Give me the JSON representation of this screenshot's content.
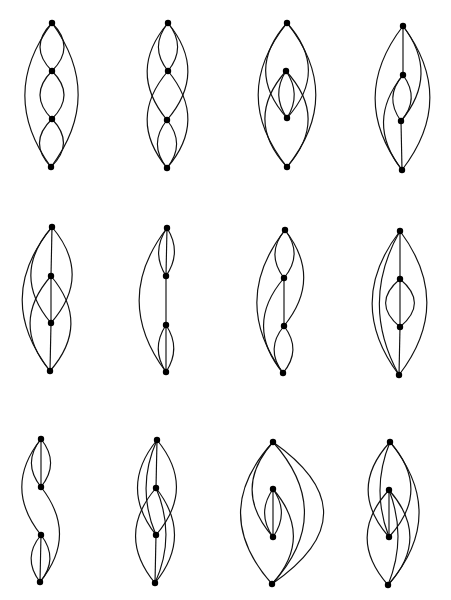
{
  "colors": {
    "edge": "#111111",
    "node": "#000000",
    "background": "#ffffff"
  },
  "graphs": [
    {
      "id": "g1",
      "edges": [
        {
          "a": 0,
          "b": 1,
          "bend": 0.5
        },
        {
          "a": 0,
          "b": 1,
          "bend": -0.5
        },
        {
          "a": 1,
          "b": 2,
          "bend": 0.5
        },
        {
          "a": 1,
          "b": 2,
          "bend": -0.5
        },
        {
          "a": 2,
          "b": 3,
          "bend": 0.5
        },
        {
          "a": 2,
          "b": 3,
          "bend": -0.5
        },
        {
          "a": 0,
          "b": 3,
          "bend": 0.37
        },
        {
          "a": 0,
          "b": 3,
          "bend": -0.37
        }
      ]
    },
    {
      "id": "g2",
      "edges": [
        {
          "a": 0,
          "b": 1,
          "bend": 0.4
        },
        {
          "a": 0,
          "b": 1,
          "bend": -0.4
        },
        {
          "a": 2,
          "b": 3,
          "bend": 0.4
        },
        {
          "a": 2,
          "b": 3,
          "bend": -0.4
        },
        {
          "a": 0,
          "b": 2,
          "bend": 0.42
        },
        {
          "a": 0,
          "b": 2,
          "bend": -0.42
        },
        {
          "a": 1,
          "b": 3,
          "bend": 0.42
        },
        {
          "a": 1,
          "b": 3,
          "bend": -0.42
        }
      ]
    },
    {
      "id": "g3",
      "edges": [
        {
          "a": 1,
          "b": 2,
          "bend": 0.33
        },
        {
          "a": 1,
          "b": 2,
          "bend": -0.33
        },
        {
          "a": 0,
          "b": 2,
          "bend": 0.45
        },
        {
          "a": 0,
          "b": 2,
          "bend": -0.45
        },
        {
          "a": 1,
          "b": 3,
          "bend": 0.45
        },
        {
          "a": 1,
          "b": 3,
          "bend": -0.45
        },
        {
          "a": 0,
          "b": 3,
          "bend": 0.4
        },
        {
          "a": 0,
          "b": 3,
          "bend": -0.4
        }
      ]
    },
    {
      "id": "g4",
      "edges": [
        {
          "a": 0,
          "b": 1,
          "bend": 0
        },
        {
          "a": 2,
          "b": 3,
          "bend": 0
        },
        {
          "a": 1,
          "b": 2,
          "bend": 0.4
        },
        {
          "a": 1,
          "b": 2,
          "bend": -0.4
        },
        {
          "a": 0,
          "b": 2,
          "bend": -0.4
        },
        {
          "a": 1,
          "b": 3,
          "bend": 0.4
        },
        {
          "a": 0,
          "b": 3,
          "bend": 0.38
        },
        {
          "a": 0,
          "b": 3,
          "bend": -0.38
        }
      ]
    },
    {
      "id": "g5",
      "edges": [
        {
          "a": 0,
          "b": 1,
          "bend": 0
        },
        {
          "a": 1,
          "b": 2,
          "bend": 0
        },
        {
          "a": 2,
          "b": 3,
          "bend": 0
        },
        {
          "a": 0,
          "b": 2,
          "bend": 0.43
        },
        {
          "a": 0,
          "b": 2,
          "bend": -0.43
        },
        {
          "a": 1,
          "b": 3,
          "bend": 0.43
        },
        {
          "a": 1,
          "b": 3,
          "bend": -0.43
        },
        {
          "a": 0,
          "b": 3,
          "bend": 0.4
        }
      ]
    },
    {
      "id": "g6",
      "edges": [
        {
          "a": 0,
          "b": 1,
          "bend": 0.33
        },
        {
          "a": 0,
          "b": 1,
          "bend": -0.33
        },
        {
          "a": 0,
          "b": 1,
          "bend": 0
        },
        {
          "a": 1,
          "b": 2,
          "bend": 0
        },
        {
          "a": 2,
          "b": 3,
          "bend": 0.33
        },
        {
          "a": 2,
          "b": 3,
          "bend": -0.33
        },
        {
          "a": 2,
          "b": 3,
          "bend": 0
        },
        {
          "a": 0,
          "b": 3,
          "bend": 0.38
        }
      ]
    },
    {
      "id": "g7",
      "edges": [
        {
          "a": 0,
          "b": 1,
          "bend": 0.4
        },
        {
          "a": 0,
          "b": 1,
          "bend": -0.4
        },
        {
          "a": 1,
          "b": 2,
          "bend": 0
        },
        {
          "a": 2,
          "b": 3,
          "bend": 0.4
        },
        {
          "a": 2,
          "b": 3,
          "bend": -0.4
        },
        {
          "a": 0,
          "b": 2,
          "bend": -0.4
        },
        {
          "a": 1,
          "b": 3,
          "bend": 0.42
        },
        {
          "a": 0,
          "b": 3,
          "bend": 0.38
        }
      ]
    },
    {
      "id": "g8",
      "edges": [
        {
          "a": 0,
          "b": 1,
          "bend": 0
        },
        {
          "a": 1,
          "b": 2,
          "bend": 0
        },
        {
          "a": 2,
          "b": 3,
          "bend": 0
        },
        {
          "a": 1,
          "b": 2,
          "bend": 0.6
        },
        {
          "a": 1,
          "b": 2,
          "bend": -0.6
        },
        {
          "a": 0,
          "b": 3,
          "bend": 0.38
        },
        {
          "a": 0,
          "b": 3,
          "bend": -0.38
        },
        {
          "a": 0,
          "b": 3,
          "bend": 0.28
        }
      ]
    },
    {
      "id": "g9",
      "edges": [
        {
          "a": 0,
          "b": 1,
          "bend": 0
        },
        {
          "a": 0,
          "b": 1,
          "bend": 0.4
        },
        {
          "a": 0,
          "b": 1,
          "bend": -0.4
        },
        {
          "a": 2,
          "b": 3,
          "bend": 0
        },
        {
          "a": 2,
          "b": 3,
          "bend": 0.4
        },
        {
          "a": 2,
          "b": 3,
          "bend": -0.4
        },
        {
          "a": 0,
          "b": 2,
          "bend": 0.4
        },
        {
          "a": 1,
          "b": 3,
          "bend": -0.4
        }
      ]
    },
    {
      "id": "g10",
      "edges": [
        {
          "a": 0,
          "b": 1,
          "bend": 0
        },
        {
          "a": 2,
          "b": 3,
          "bend": 0
        },
        {
          "a": 0,
          "b": 2,
          "bend": 0.4
        },
        {
          "a": 0,
          "b": 2,
          "bend": 0.22
        },
        {
          "a": 0,
          "b": 2,
          "bend": -0.42
        },
        {
          "a": 1,
          "b": 3,
          "bend": 0.42
        },
        {
          "a": 1,
          "b": 3,
          "bend": -0.4
        },
        {
          "a": 1,
          "b": 3,
          "bend": -0.22
        }
      ]
    },
    {
      "id": "g11",
      "edges": [
        {
          "a": 1,
          "b": 2,
          "bend": 0
        },
        {
          "a": 1,
          "b": 2,
          "bend": 0.35
        },
        {
          "a": 1,
          "b": 2,
          "bend": -0.35
        },
        {
          "a": 0,
          "b": 2,
          "bend": 0.44
        },
        {
          "a": 1,
          "b": 3,
          "bend": -0.44
        },
        {
          "a": 0,
          "b": 3,
          "bend": 0.45
        },
        {
          "a": 0,
          "b": 3,
          "bend": -0.45
        },
        {
          "a": 0,
          "b": 3,
          "bend": -0.72
        }
      ]
    },
    {
      "id": "g12",
      "edges": [
        {
          "a": 1,
          "b": 2,
          "bend": 0
        },
        {
          "a": 0,
          "b": 2,
          "bend": 0.45
        },
        {
          "a": 0,
          "b": 2,
          "bend": -0.45
        },
        {
          "a": 0,
          "b": 2,
          "bend": 0.2
        },
        {
          "a": 1,
          "b": 3,
          "bend": 0.45
        },
        {
          "a": 1,
          "b": 3,
          "bend": -0.45
        },
        {
          "a": 1,
          "b": 3,
          "bend": -0.2
        },
        {
          "a": 0,
          "b": 3,
          "bend": -0.42
        }
      ]
    }
  ]
}
